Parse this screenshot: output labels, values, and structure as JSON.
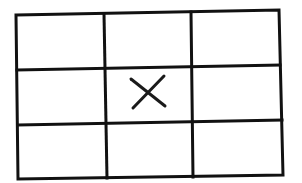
{
  "diagram": {
    "type": "tic-tac-toe grid",
    "rows": 3,
    "columns": 3,
    "cells": [
      [
        "",
        "",
        ""
      ],
      [
        "",
        "X",
        ""
      ],
      [
        "",
        "",
        ""
      ]
    ],
    "marked_cell": {
      "row": 1,
      "column": 1,
      "mark": "X"
    },
    "colors": {
      "line": "#111111",
      "background": "#ffffff"
    }
  }
}
